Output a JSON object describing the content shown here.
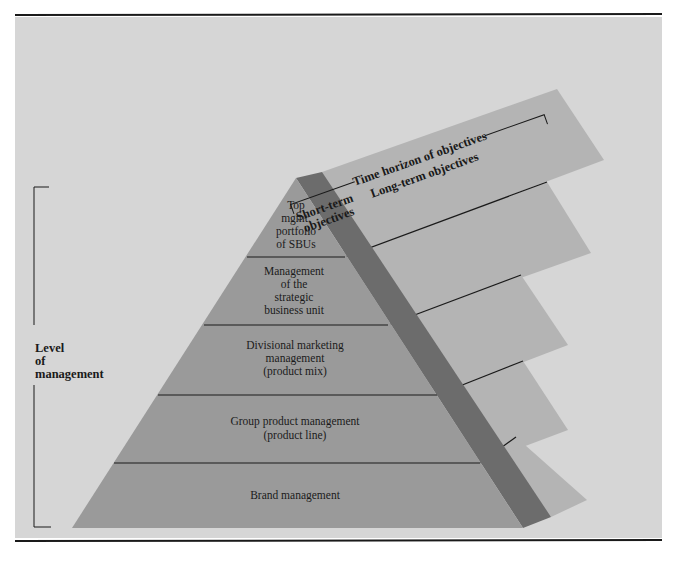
{
  "figure": {
    "colors": {
      "page": "#ffffff",
      "panel": "#d6d6d6",
      "front_face": "#9a9a9a",
      "side_band": "#6c6c6c",
      "shelf": "#b4b4b4",
      "rule": "#1a1a1a"
    },
    "time_axis": {
      "title": "Time horizon of objectives",
      "short_term_line1": "Short-term",
      "short_term_line2": "objectives",
      "long_term": "Long-term objectives"
    },
    "level_axis": {
      "line1": "Level",
      "line2": "of",
      "line3": "management"
    },
    "layers": [
      {
        "lines": [
          "Top",
          "mgmt.",
          "portfolio",
          "of SBUs"
        ]
      },
      {
        "lines": [
          "Management",
          "of the",
          "strategic",
          "business unit"
        ]
      },
      {
        "lines": [
          "Divisional marketing",
          "management",
          "(product mix)"
        ]
      },
      {
        "lines": [
          "Group product management",
          "(product line)"
        ]
      },
      {
        "lines": [
          "Brand management"
        ]
      }
    ]
  }
}
